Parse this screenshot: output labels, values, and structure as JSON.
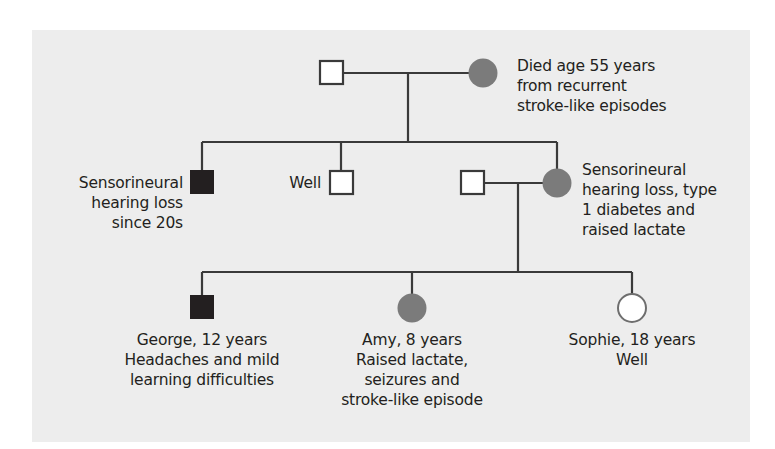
{
  "diagram": {
    "type": "pedigree",
    "colors": {
      "background_panel": "#ededed",
      "line": "#3a3a3a",
      "affected_filled": "#231f20",
      "affected_partial_gray": "#7b7b7b",
      "unaffected_fill": "#ffffff"
    },
    "generation_1": {
      "father": {
        "sex": "male",
        "status": "unaffected",
        "label_lines": []
      },
      "mother": {
        "sex": "female",
        "status": "affected-gray",
        "label_lines": [
          "Died age 55 years",
          "from recurrent",
          "stroke-like episodes"
        ]
      }
    },
    "generation_2": {
      "son_affected": {
        "sex": "male",
        "status": "affected-black",
        "label_lines": [
          "Sensorineural",
          "hearing loss",
          "since 20s"
        ]
      },
      "son_well": {
        "sex": "male",
        "status": "unaffected",
        "label_lines": [
          "Well"
        ]
      },
      "daughter": {
        "sex": "female",
        "status": "affected-gray",
        "label_lines": [
          "Sensorineural",
          "hearing loss, type",
          "1 diabetes and",
          "raised lactate"
        ]
      },
      "daughter_spouse": {
        "sex": "male",
        "status": "unaffected",
        "label_lines": []
      }
    },
    "generation_3": {
      "george": {
        "sex": "male",
        "status": "affected-black",
        "label_lines": [
          "George, 12 years",
          "Headaches and mild",
          "learning difficulties"
        ]
      },
      "amy": {
        "sex": "female",
        "status": "affected-gray",
        "label_lines": [
          "Amy, 8 years",
          "Raised lactate,",
          "seizures and",
          "stroke-like episode"
        ]
      },
      "sophie": {
        "sex": "female",
        "status": "unaffected",
        "label_lines": [
          "Sophie, 18 years",
          "Well"
        ]
      }
    }
  }
}
